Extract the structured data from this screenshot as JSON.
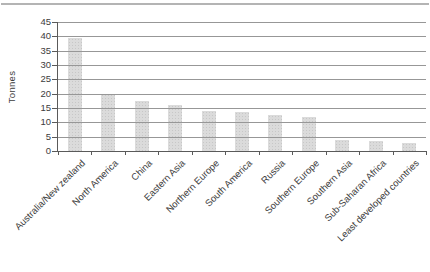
{
  "page": {
    "top_rule_color": "#b4b4b4",
    "background_color": "#ffffff"
  },
  "chart_data": {
    "type": "bar",
    "title": "",
    "xlabel": "",
    "ylabel": "Tonnes",
    "categories": [
      "Australia/New zealand",
      "North America",
      "China",
      "Eastern Asia",
      "Northern Europe",
      "South America",
      "Russia",
      "Southern Europe",
      "Southern Asia",
      "Sub-Saharan Africa",
      "Least developed countries"
    ],
    "values": [
      39.5,
      20,
      17.5,
      16,
      14,
      13.5,
      12.5,
      12,
      4,
      3.5,
      2.8
    ],
    "ylim": [
      0,
      45
    ],
    "yticks": [
      0,
      5,
      10,
      15,
      20,
      25,
      30,
      35,
      40,
      45
    ],
    "grid": "horizontal-on",
    "legend": "none",
    "bar_color": "#dbdbdb",
    "bar_texture_color": "#c7c7c7",
    "gridline_color": "#979797",
    "axis_color": "#5a5a5a",
    "text_color": "#3c3c3c"
  }
}
